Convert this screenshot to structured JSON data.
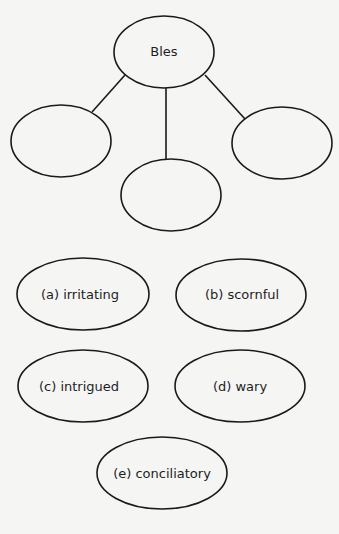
{
  "web": {
    "center": {
      "label": "Bles",
      "cx": 164,
      "cy": 52,
      "rx": 50,
      "ry": 36
    },
    "spokes": [
      {
        "label": "",
        "cx": 61,
        "cy": 141,
        "rx": 50,
        "ry": 36
      },
      {
        "label": "",
        "cx": 171,
        "cy": 195,
        "rx": 50,
        "ry": 36
      },
      {
        "label": "",
        "cx": 282,
        "cy": 143,
        "rx": 50,
        "ry": 36
      }
    ]
  },
  "options": [
    {
      "label": "(a) irritating",
      "cx": 83,
      "cy": 294,
      "rx": 66,
      "ry": 36
    },
    {
      "label": "(b) scornful",
      "cx": 241,
      "cy": 295,
      "rx": 65,
      "ry": 36
    },
    {
      "label": "(c) intrigued",
      "cx": 83,
      "cy": 386,
      "rx": 65,
      "ry": 36
    },
    {
      "label": "(d) wary",
      "cx": 240,
      "cy": 386,
      "rx": 65,
      "ry": 36
    },
    {
      "label": "(e) conciliatory",
      "cx": 162,
      "cy": 473,
      "rx": 65,
      "ry": 36
    }
  ],
  "colors": {
    "stroke": "#1a1a1a",
    "background": "#f5f5f4",
    "text": "#1e1e1e"
  }
}
